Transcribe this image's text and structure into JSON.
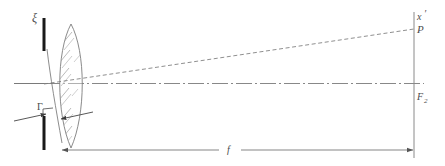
{
  "figure": {
    "type": "optics-ray-diagram",
    "background_color": "#ffffff",
    "ink_color": "#555555",
    "bar_color": "#1a1a1a",
    "labels": {
      "aperture_height": "ξ",
      "lens_thickness": "Γ",
      "image_height": "x",
      "image_height_prime": "′",
      "image_point": "P",
      "focal_point": "F",
      "focal_point_subscript": "2",
      "focal_length": "f"
    },
    "elements": {
      "aperture_stop_name": "aperture-stop",
      "lens_name": "biconvex-lens",
      "optical_axis_name": "optical-axis",
      "chief_ray_name": "chief-ray",
      "image_plane_name": "image-plane",
      "focal_dimension_name": "focal-length-dimension",
      "thickness_dimension_name": "lens-thickness-dimension"
    }
  }
}
